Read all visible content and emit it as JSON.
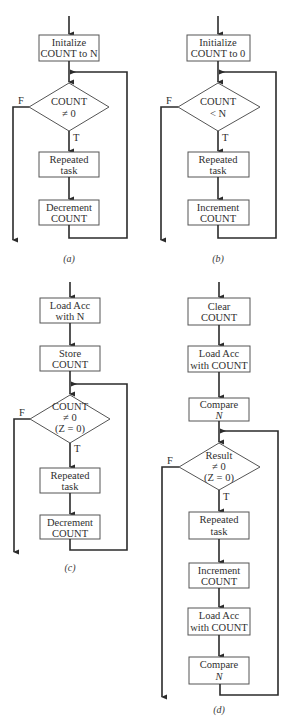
{
  "figure": {
    "panels": [
      {
        "caption": "(a)",
        "steps": [
          {
            "type": "process",
            "lines": [
              "Initalize",
              "COUNT to N"
            ]
          },
          {
            "type": "decision",
            "lines": [
              "COUNT",
              "≠ 0"
            ],
            "true_label": "T",
            "false_label": "F"
          },
          {
            "type": "process",
            "lines": [
              "Repeated",
              "task"
            ]
          },
          {
            "type": "process",
            "lines": [
              "Decrement",
              "COUNT"
            ]
          }
        ]
      },
      {
        "caption": "(b)",
        "steps": [
          {
            "type": "process",
            "lines": [
              "Initialize",
              "COUNT to 0"
            ]
          },
          {
            "type": "decision",
            "lines": [
              "COUNT",
              "< N"
            ],
            "true_label": "T",
            "false_label": "F"
          },
          {
            "type": "process",
            "lines": [
              "Repeated",
              "task"
            ]
          },
          {
            "type": "process",
            "lines": [
              "Increment",
              "COUNT"
            ]
          }
        ]
      },
      {
        "caption": "(c)",
        "steps": [
          {
            "type": "process",
            "lines": [
              "Load Acc",
              "with N"
            ]
          },
          {
            "type": "process",
            "lines": [
              "Store",
              "COUNT"
            ]
          },
          {
            "type": "decision",
            "lines": [
              "COUNT",
              "≠ 0",
              "(Z = 0)"
            ],
            "true_label": "T",
            "false_label": "F"
          },
          {
            "type": "process",
            "lines": [
              "Repeated",
              "task"
            ]
          },
          {
            "type": "process",
            "lines": [
              "Decrement",
              "COUNT"
            ]
          }
        ]
      },
      {
        "caption": "(d)",
        "steps": [
          {
            "type": "process",
            "lines": [
              "Clear",
              "COUNT"
            ]
          },
          {
            "type": "process",
            "lines": [
              "Load Acc",
              "with COUNT"
            ]
          },
          {
            "type": "process",
            "lines": [
              "Compare",
              "N"
            ]
          },
          {
            "type": "decision",
            "lines": [
              "Result",
              "≠ 0",
              "(Z = 0)"
            ],
            "true_label": "T",
            "false_label": "F"
          },
          {
            "type": "process",
            "lines": [
              "Repeated",
              "task"
            ]
          },
          {
            "type": "process",
            "lines": [
              "Increment",
              "COUNT"
            ]
          },
          {
            "type": "process",
            "lines": [
              "Load Acc",
              "with COUNT"
            ]
          },
          {
            "type": "process",
            "lines": [
              "Compare",
              "N"
            ]
          }
        ]
      }
    ]
  }
}
